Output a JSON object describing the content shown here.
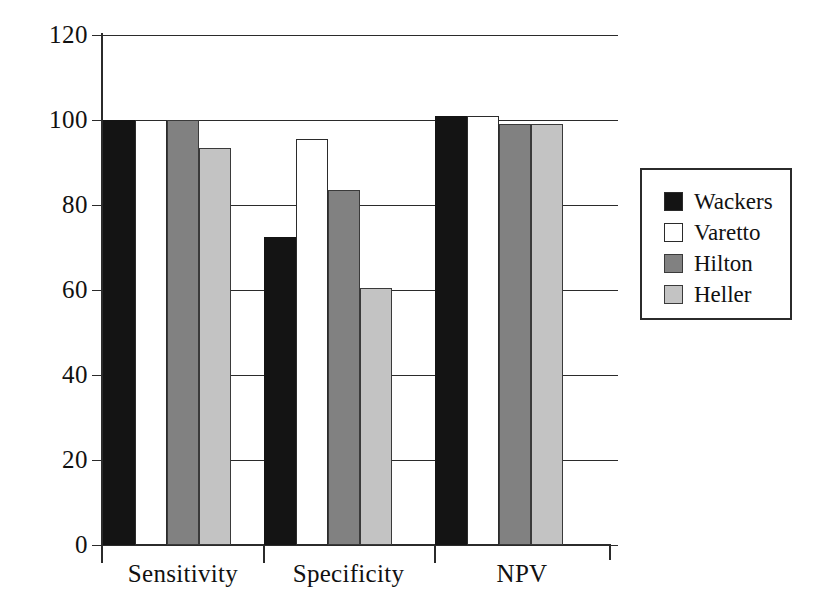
{
  "chart_data": {
    "type": "bar",
    "title": "",
    "xlabel": "",
    "ylabel": "",
    "categories": [
      "Sensitivity",
      "Specificity",
      "NPV"
    ],
    "series": [
      {
        "name": "Wackers",
        "color": "#141414",
        "values": [
          100,
          72.5,
          101
        ]
      },
      {
        "name": "Varetto",
        "color": "#ffffff",
        "values": [
          100,
          95.5,
          101
        ]
      },
      {
        "name": "Hilton",
        "color": "#818181",
        "values": [
          100,
          83.5,
          99
        ]
      },
      {
        "name": "Heller",
        "color": "#c3c3c3",
        "values": [
          93.5,
          60.5,
          99
        ]
      }
    ],
    "ylim": [
      0,
      120
    ],
    "yticks": [
      0,
      20,
      40,
      60,
      80,
      100,
      120
    ],
    "ytick_labels": [
      "0",
      "20",
      "40",
      "60",
      "80",
      "100",
      "120"
    ],
    "grid": true,
    "grid_axis": "y",
    "legend_position": "right-outside",
    "legend_entries": [
      "Wackers",
      "Varetto",
      "Hilton",
      "Heller"
    ]
  }
}
